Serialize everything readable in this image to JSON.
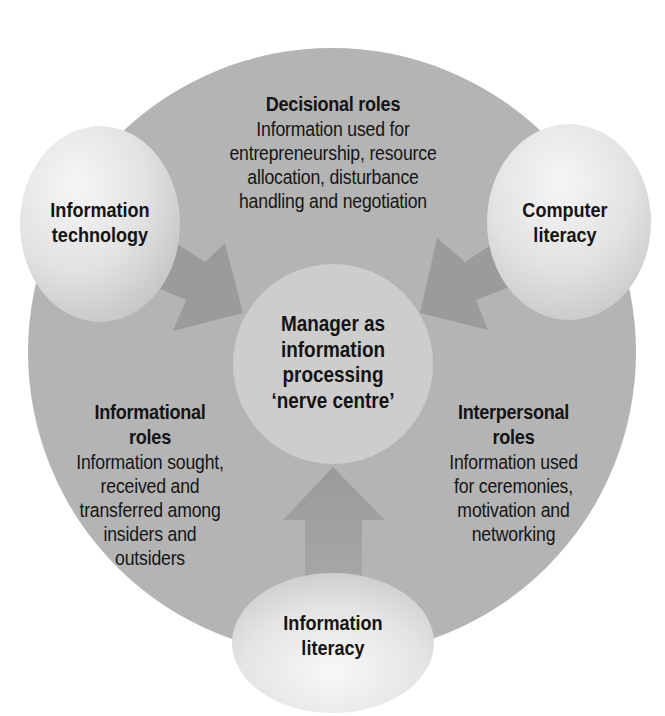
{
  "diagram": {
    "colors": {
      "background": "#ffffff",
      "main_circle": "#b4b4b4",
      "arrows": "#9b9b9b",
      "center_circle": "#cdcdcd",
      "bubble_light": "#f4f4f4",
      "bubble_dark": "#c4c4c4",
      "text": "#141414"
    },
    "center": {
      "label": "Manager as\ninformation\nprocessing\n‘nerve centre’"
    },
    "sectors": {
      "decisional": {
        "title": "Decisional roles",
        "description": "Information used for\nentrepreneurship, resource\nallocation, disturbance\nhandling and negotiation"
      },
      "informational": {
        "title": "Informational\nroles",
        "description": "Information sought,\nreceived and\ntransferred among\ninsiders and\noutsiders"
      },
      "interpersonal": {
        "title": "Interpersonal\nroles",
        "description": "Information used\nfor ceremonies,\nmotivation and\nnetworking"
      }
    },
    "inputs": {
      "information_technology": {
        "label": "Information\ntechnology"
      },
      "computer_literacy": {
        "label": "Computer\nliteracy"
      },
      "information_literacy": {
        "label": "Information\nliteracy"
      }
    }
  }
}
